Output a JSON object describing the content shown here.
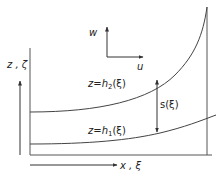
{
  "diagram": {
    "type": "channel-flow-schematic",
    "labels": {
      "vertical_axis": "z , ζ",
      "horizontal_axis": "x , ξ",
      "velocity_w": "w",
      "velocity_u": "u",
      "upper_surface_prefix": "z=h",
      "upper_surface_sub": "2",
      "upper_surface_suffix": "(ξ)",
      "lower_surface_prefix": "z=h",
      "lower_surface_sub": "1",
      "lower_surface_suffix": "(ξ)",
      "separation": "s(ξ)"
    },
    "colors": {
      "line": "#444444",
      "text": "#222222",
      "background": "#ffffff"
    }
  }
}
